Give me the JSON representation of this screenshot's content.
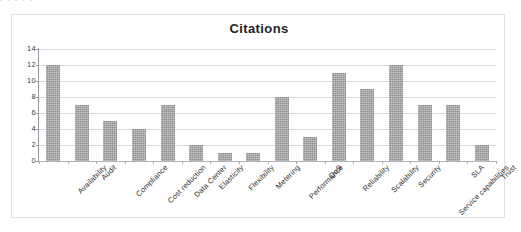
{
  "top_clip_fragment": "p  p      p   p          p",
  "chart_data": {
    "type": "bar",
    "title": "Citations",
    "xlabel": "",
    "ylabel": "",
    "ylim": [
      0,
      14
    ],
    "ytick_labels": [
      "0",
      "2",
      "4",
      "6",
      "8",
      "10",
      "12",
      "14"
    ],
    "ytick_values": [
      0,
      2,
      4,
      6,
      8,
      10,
      12,
      14
    ],
    "grid": true,
    "legend": "none",
    "bar_color": "#8f8f8f",
    "categories": [
      "Availability",
      "Audit",
      "Compliance",
      "Cost reduction",
      "Data Center",
      "Elasticity",
      "Flexibility",
      "Metering",
      "Performance",
      "QoS",
      "Reliability",
      "Scalability",
      "Security",
      "Service capabilities",
      "SLA",
      "Trust"
    ],
    "values": [
      12,
      7,
      5,
      4,
      7,
      2,
      1,
      1,
      8,
      3,
      11,
      9,
      12,
      7,
      7,
      2
    ]
  }
}
